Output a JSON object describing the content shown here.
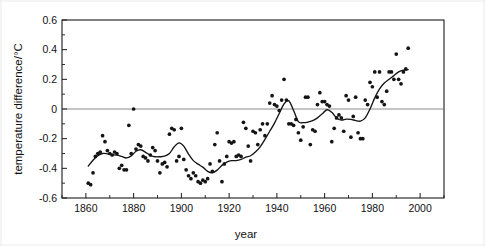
{
  "chart_data": {
    "type": "scatter",
    "title": "",
    "xlabel": "year",
    "ylabel": "temperature difference/°C",
    "xlim": [
      1850,
      2010
    ],
    "ylim": [
      -0.6,
      0.6
    ],
    "grid": false,
    "legend": null,
    "x_ticks": [
      1860,
      1880,
      1900,
      1920,
      1940,
      1960,
      1980,
      2000
    ],
    "y_ticks": [
      0.6,
      0.4,
      0.2,
      0,
      -0.2,
      -0.4,
      -0.6
    ],
    "y_tick_labels": [
      "0.6",
      "0.4",
      "0.2",
      "0",
      "-0.2",
      "-0.4",
      "-0.6"
    ],
    "x_tick_labels": [
      "1860",
      "1880",
      "1900",
      "1920",
      "1940",
      "1960",
      "1980",
      "2000"
    ],
    "annotations": [
      "horizontal reference line at 0"
    ],
    "series": [
      {
        "name": "annual temperature difference",
        "marker": "filled-circle",
        "color": "#141414",
        "x": [
          1861,
          1862,
          1863,
          1864,
          1865,
          1866,
          1867,
          1868,
          1869,
          1870,
          1871,
          1872,
          1873,
          1874,
          1875,
          1876,
          1877,
          1878,
          1879,
          1880,
          1881,
          1882,
          1883,
          1884,
          1885,
          1886,
          1887,
          1888,
          1889,
          1890,
          1891,
          1892,
          1893,
          1894,
          1895,
          1896,
          1897,
          1898,
          1899,
          1900,
          1901,
          1902,
          1903,
          1904,
          1905,
          1906,
          1907,
          1908,
          1909,
          1910,
          1911,
          1912,
          1913,
          1914,
          1915,
          1916,
          1917,
          1918,
          1919,
          1920,
          1921,
          1922,
          1923,
          1924,
          1925,
          1926,
          1927,
          1928,
          1929,
          1930,
          1931,
          1932,
          1933,
          1934,
          1935,
          1936,
          1937,
          1938,
          1939,
          1940,
          1941,
          1942,
          1943,
          1944,
          1945,
          1946,
          1947,
          1948,
          1949,
          1950,
          1951,
          1952,
          1953,
          1954,
          1955,
          1956,
          1957,
          1958,
          1959,
          1960,
          1961,
          1962,
          1963,
          1964,
          1965,
          1966,
          1967,
          1968,
          1969,
          1970,
          1971,
          1972,
          1973,
          1974,
          1975,
          1976,
          1977,
          1978,
          1979,
          1980,
          1981,
          1982,
          1983,
          1984,
          1985,
          1986,
          1987,
          1988,
          1989,
          1990,
          1991,
          1992,
          1993,
          1994,
          1995
        ],
        "y": [
          -0.5,
          -0.51,
          -0.43,
          -0.32,
          -0.3,
          -0.29,
          -0.18,
          -0.22,
          -0.28,
          -0.3,
          -0.31,
          -0.29,
          -0.3,
          -0.4,
          -0.38,
          -0.41,
          -0.41,
          -0.11,
          -0.3,
          0.0,
          -0.27,
          -0.24,
          -0.25,
          -0.32,
          -0.33,
          -0.35,
          -0.31,
          -0.26,
          -0.28,
          -0.35,
          -0.43,
          -0.37,
          -0.36,
          -0.39,
          -0.17,
          -0.13,
          -0.14,
          -0.35,
          -0.32,
          -0.13,
          -0.34,
          -0.41,
          -0.45,
          -0.47,
          -0.43,
          -0.45,
          -0.49,
          -0.5,
          -0.48,
          -0.49,
          -0.47,
          -0.37,
          -0.42,
          -0.24,
          -0.16,
          -0.35,
          -0.49,
          -0.37,
          -0.32,
          -0.22,
          -0.23,
          -0.22,
          -0.32,
          -0.31,
          -0.32,
          -0.09,
          -0.13,
          -0.25,
          -0.35,
          -0.15,
          -0.16,
          -0.24,
          -0.14,
          -0.1,
          -0.18,
          -0.1,
          0.04,
          0.09,
          0.03,
          0.02,
          -0.01,
          0.06,
          0.2,
          0.06,
          -0.1,
          -0.1,
          -0.11,
          -0.07,
          -0.16,
          -0.21,
          -0.12,
          0.08,
          0.08,
          -0.24,
          -0.14,
          -0.15,
          0.03,
          0.11,
          0.05,
          0.05,
          0.03,
          0.02,
          -0.22,
          -0.13,
          -0.06,
          -0.04,
          -0.06,
          -0.15,
          0.09,
          0.06,
          -0.19,
          -0.05,
          0.08,
          -0.16,
          -0.2,
          -0.2,
          0.06,
          0.03,
          0.18,
          0.15,
          0.25,
          0.08,
          0.25,
          0.05,
          0.03,
          0.12,
          0.25,
          0.25,
          0.2,
          0.37,
          0.2,
          0.17,
          0.25,
          0.27,
          0.41
        ]
      }
    ],
    "smoothed_curve": {
      "name": "smoothed trend",
      "color": "#141414",
      "x": [
        1861,
        1863,
        1865,
        1867,
        1869,
        1871,
        1873,
        1875,
        1877,
        1879,
        1881,
        1883,
        1885,
        1887,
        1889,
        1891,
        1893,
        1895,
        1897,
        1899,
        1901,
        1903,
        1905,
        1907,
        1909,
        1911,
        1913,
        1915,
        1917,
        1919,
        1921,
        1923,
        1925,
        1927,
        1929,
        1931,
        1933,
        1935,
        1937,
        1939,
        1941,
        1943,
        1945,
        1947,
        1949,
        1951,
        1953,
        1955,
        1957,
        1959,
        1961,
        1963,
        1965,
        1967,
        1969,
        1971,
        1973,
        1975,
        1977,
        1979,
        1981,
        1983,
        1985,
        1987,
        1989,
        1991,
        1993,
        1995
      ],
      "y": [
        -0.385,
        -0.345,
        -0.315,
        -0.3,
        -0.302,
        -0.308,
        -0.311,
        -0.32,
        -0.33,
        -0.316,
        -0.285,
        -0.275,
        -0.292,
        -0.312,
        -0.322,
        -0.322,
        -0.318,
        -0.3,
        -0.255,
        -0.228,
        -0.25,
        -0.305,
        -0.348,
        -0.372,
        -0.392,
        -0.42,
        -0.43,
        -0.412,
        -0.38,
        -0.358,
        -0.348,
        -0.348,
        -0.34,
        -0.325,
        -0.315,
        -0.29,
        -0.255,
        -0.205,
        -0.15,
        -0.095,
        -0.03,
        0.035,
        0.055,
        -0.01,
        -0.085,
        -0.092,
        -0.088,
        -0.078,
        -0.06,
        -0.032,
        -0.005,
        -0.022,
        -0.06,
        -0.075,
        -0.068,
        -0.07,
        -0.078,
        -0.082,
        -0.06,
        0.0,
        0.075,
        0.135,
        0.175,
        0.2,
        0.225,
        0.25,
        0.262,
        0.265
      ]
    }
  },
  "figure": {
    "background_color": "#ffffff",
    "axis_color": "#1a1a1a",
    "marker_color": "#141414",
    "zero_line_color": "#7d7d7d"
  }
}
